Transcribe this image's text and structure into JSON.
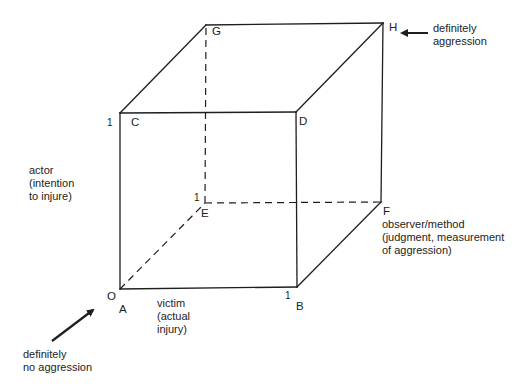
{
  "diagram": {
    "type": "3D cube model of aggression",
    "stroke_color": "#1e1e1e",
    "background": "#ffffff",
    "vertices": {
      "A": {
        "label": "A"
      },
      "B": {
        "label": "B"
      },
      "C": {
        "label": "C"
      },
      "D": {
        "label": "D"
      },
      "E": {
        "label": "E"
      },
      "F": {
        "label": "F"
      },
      "G": {
        "label": "G"
      },
      "H": {
        "label": "H"
      }
    },
    "origin_label": "O",
    "ticks": {
      "victim_axis": "1",
      "actor_axis": "1",
      "observer_axis": "1"
    },
    "axes": {
      "actor": {
        "line1": "actor",
        "line2": "(intention",
        "line3": "to injure)"
      },
      "victim": {
        "line1": "victim",
        "line2": "(actual",
        "line3": "injury)"
      },
      "observer": {
        "line1": "observer/method",
        "line2": "(judgment, measurement",
        "line3": "of aggression)"
      }
    },
    "annotations": {
      "definitely_aggression": {
        "line1": "definitely",
        "line2": "aggression",
        "points_to": "H"
      },
      "definitely_no_aggression": {
        "line1": "definitely",
        "line2": "no aggression",
        "points_to": "A"
      }
    }
  }
}
